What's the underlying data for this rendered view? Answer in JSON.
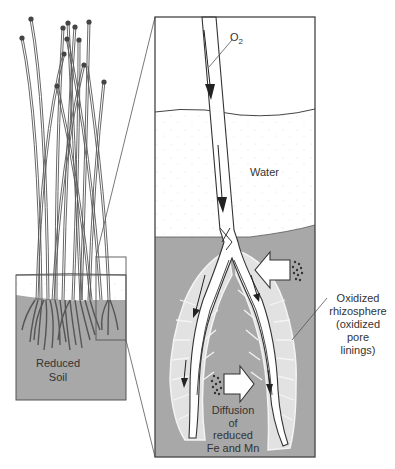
{
  "diagram": {
    "labels": {
      "o2": "O",
      "o2_sub": "2",
      "water": "Water",
      "reduced_soil_1": "Reduced",
      "reduced_soil_2": "Soil",
      "oxidized_1": "Oxidized",
      "oxidized_2": "rhizosphere",
      "oxidized_3": "(oxidized",
      "oxidized_4": "pore",
      "oxidized_5": "linings)",
      "diffusion_1": "Diffusion",
      "diffusion_2": "of",
      "diffusion_3": "reduced",
      "diffusion_4": "Fe and Mn"
    },
    "colors": {
      "soil": "#a8a8a8",
      "water_dots": "#f7f7f7",
      "rhizosphere": "#e4e4e4",
      "outline": "#444444",
      "background": "#ffffff"
    },
    "panels": {
      "overview": "Wetland plant in flooded, reduced soil",
      "detail": "Enlarged root zone showing O2 transport and oxidized rhizosphere"
    }
  }
}
